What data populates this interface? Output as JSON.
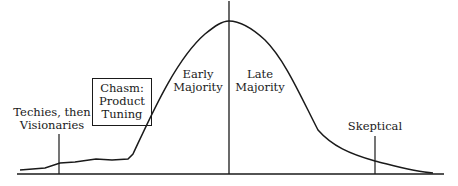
{
  "diagram": {
    "type": "technology-adoption-lifecycle",
    "segments": {
      "techies": {
        "lines": [
          "Techies, then",
          "Visionaries"
        ]
      },
      "chasm": {
        "lines": [
          "Chasm:",
          "Product",
          "Tuning"
        ]
      },
      "early_majority": {
        "lines": [
          "Early",
          "Majority"
        ]
      },
      "late_majority": {
        "lines": [
          "Late",
          "Majority"
        ]
      },
      "skeptical": {
        "lines": [
          "Skeptical"
        ]
      }
    },
    "colors": {
      "ink": "#1a1a1a",
      "background": "#ffffff"
    }
  }
}
